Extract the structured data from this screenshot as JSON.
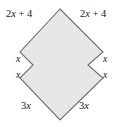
{
  "figure": {
    "name": "geometry-polygon-figure",
    "fill_color": "#e7e7e7",
    "stroke_color": "#6e6e6e",
    "background_color": "#ffffff",
    "shape_points": "60,9 103,52 88,65 103,78 60,120 20,78 33,65 20,52",
    "labels": {
      "top_left": "2x + 4",
      "top_right": "2x + 4",
      "left_upper": "x",
      "left_lower": "x",
      "right_upper": "x",
      "right_lower": "x",
      "bottom_left": "3x",
      "bottom_right": "3x"
    },
    "label_parts": {
      "coef2": "2",
      "var": "x",
      "plus4": " + 4",
      "coef3": "3"
    }
  }
}
